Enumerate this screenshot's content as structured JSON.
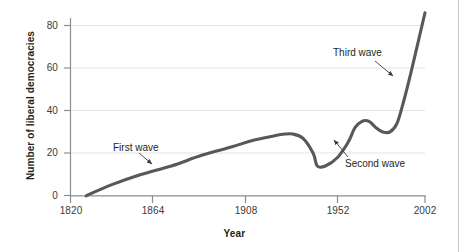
{
  "chart_data": {
    "type": "line",
    "title": "",
    "xlabel": "Year",
    "ylabel": "Number of liberal democracies",
    "xlim": [
      1820,
      2002
    ],
    "ylim": [
      0,
      88
    ],
    "xticks": [
      1820,
      1864,
      1908,
      1952,
      2002
    ],
    "xtick_labels": [
      "1820",
      "1864",
      "1908",
      "1952",
      "2002"
    ],
    "yticks": [
      0,
      20,
      40,
      60,
      80
    ],
    "ytick_labels": [
      "0",
      "20",
      "40",
      "60",
      "80"
    ],
    "grid": "horizontal",
    "legend": "none",
    "series": [
      {
        "name": "Number of liberal democracies",
        "color": "#58585a",
        "x": [
          1828,
          1840,
          1855,
          1870,
          1885,
          1900,
          1910,
          1920,
          1926,
          1930,
          1935,
          1940,
          1942,
          1946,
          1952,
          1958,
          1962,
          1966,
          1970,
          1974,
          1978,
          1982,
          1986,
          1990,
          1994,
          1998,
          2002
        ],
        "y": [
          0,
          5,
          10,
          14,
          19,
          23,
          26,
          28,
          29,
          29,
          27,
          20,
          14,
          14,
          18,
          25,
          32,
          35,
          35,
          32,
          30,
          30,
          34,
          45,
          58,
          72,
          86
        ]
      }
    ],
    "annotations": [
      {
        "id": "first-wave",
        "label": "First wave",
        "text_x": 1841,
        "text_y": 25,
        "arrow_to_x": 1857,
        "arrow_to_y": 14
      },
      {
        "id": "second-wave",
        "label": "Second wave",
        "text_x": 1952,
        "text_y": 16,
        "arrow_to_x": 1943,
        "arrow_to_y": 25
      },
      {
        "id": "third-wave",
        "label": "Third wave",
        "text_x": 1950,
        "text_y": 70,
        "arrow_to_x": 1975,
        "arrow_to_y": 56
      }
    ]
  },
  "axis": {
    "x_title": "Year",
    "y_title": "Number of liberal democracies"
  }
}
